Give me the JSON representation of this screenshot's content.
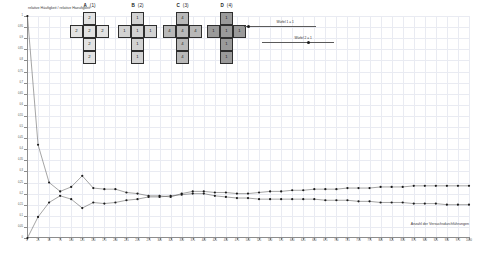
{
  "chart_data": {
    "type": "line",
    "title": "",
    "ylabel": "relative Häufigkeit / relative Haeufigkeit",
    "xlabel": "Anzahl der Versuchsdurchführungen",
    "grid": true,
    "legend_position": "top-right",
    "xlim": [
      0,
      1000
    ],
    "ylim": [
      0,
      1
    ],
    "y_ticks": [
      0,
      0.05,
      0.1,
      0.15,
      0.2,
      0.25,
      0.3,
      0.35,
      0.4,
      0.45,
      0.5,
      0.55,
      0.6,
      0.65,
      0.7,
      0.75,
      0.8,
      0.85,
      0.9,
      0.95,
      1
    ],
    "y_tick_labels": [
      "0",
      "0,05",
      "0,1",
      "0,15",
      "0,2",
      "0,25",
      "0,3",
      "0,35",
      "0,4",
      "0,45",
      "0,5",
      "0,55",
      "0,6",
      "0,65",
      "0,7",
      "0,75",
      "0,8",
      "0,85",
      "0,9",
      "0,95",
      "1"
    ],
    "x_ticks": [
      0,
      25,
      50,
      75,
      100,
      125,
      150,
      175,
      200,
      225,
      250,
      275,
      300,
      325,
      350,
      375,
      400,
      425,
      450,
      475,
      500,
      525,
      550,
      575,
      600,
      625,
      650,
      675,
      700,
      725,
      750,
      775,
      800,
      825,
      850,
      875,
      900,
      925,
      950,
      975,
      1000
    ],
    "x_tick_labels": [
      "0",
      "25",
      "50",
      "75",
      "100",
      "125",
      "150",
      "175",
      "200",
      "225",
      "250",
      "275",
      "300",
      "325",
      "350",
      "375",
      "400",
      "425",
      "450",
      "475",
      "500",
      "525",
      "550",
      "575",
      "600",
      "625",
      "650",
      "675",
      "700",
      "725",
      "750",
      "775",
      "800",
      "825",
      "850",
      "875",
      "900",
      "925",
      "950",
      "975",
      "1000"
    ],
    "series": [
      {
        "name": "Serie 1",
        "color": "#5a5a5a",
        "x": [
          1,
          25,
          50,
          75,
          100,
          125,
          150,
          175,
          200,
          225,
          250,
          275,
          300,
          325,
          350,
          375,
          400,
          425,
          450,
          475,
          500,
          525,
          550,
          575,
          600,
          625,
          650,
          675,
          700,
          725,
          750,
          775,
          800,
          825,
          850,
          875,
          900,
          925,
          950,
          975,
          1000
        ],
        "y": [
          1.0,
          0.42,
          0.25,
          0.21,
          0.23,
          0.28,
          0.225,
          0.22,
          0.22,
          0.205,
          0.2,
          0.19,
          0.19,
          0.185,
          0.2,
          0.21,
          0.21,
          0.205,
          0.205,
          0.2,
          0.2,
          0.205,
          0.21,
          0.21,
          0.215,
          0.215,
          0.22,
          0.22,
          0.22,
          0.225,
          0.225,
          0.225,
          0.23,
          0.23,
          0.23,
          0.235,
          0.235,
          0.235,
          0.235,
          0.235,
          0.235
        ]
      },
      {
        "name": "Serie 2",
        "color": "#5a5a5a",
        "x": [
          1,
          25,
          50,
          75,
          100,
          125,
          150,
          175,
          200,
          225,
          250,
          275,
          300,
          325,
          350,
          375,
          400,
          425,
          450,
          475,
          500,
          525,
          550,
          575,
          600,
          625,
          650,
          675,
          700,
          725,
          750,
          775,
          800,
          825,
          850,
          875,
          900,
          925,
          950,
          975,
          1000
        ],
        "y": [
          0.0,
          0.095,
          0.16,
          0.19,
          0.175,
          0.135,
          0.16,
          0.155,
          0.16,
          0.17,
          0.175,
          0.185,
          0.185,
          0.19,
          0.195,
          0.2,
          0.2,
          0.19,
          0.185,
          0.18,
          0.18,
          0.175,
          0.175,
          0.175,
          0.175,
          0.175,
          0.175,
          0.17,
          0.17,
          0.17,
          0.165,
          0.165,
          0.16,
          0.16,
          0.16,
          0.155,
          0.155,
          0.155,
          0.15,
          0.15,
          0.15
        ]
      }
    ]
  },
  "nets": [
    {
      "letter": "A",
      "index": "(1)",
      "shade": "#e2e2e2",
      "cells": {
        "top": "2",
        "left": "2",
        "mid": "2",
        "right": "2",
        "bot": "2",
        "bot2": "2"
      }
    },
    {
      "letter": "B",
      "index": "(2)",
      "shade": "#d2d2d2",
      "cells": {
        "top": "1",
        "left": "1",
        "mid": "1",
        "right": "1",
        "bot": "1",
        "bot2": "1"
      }
    },
    {
      "letter": "C",
      "index": "(3)",
      "shade": "#b8b8b8",
      "cells": {
        "top": "4",
        "left": "4",
        "mid": "4",
        "right": "4",
        "bot": "4",
        "bot2": "4"
      }
    },
    {
      "letter": "D",
      "index": "(4)",
      "shade": "#9a9a9a",
      "cells": {
        "top": "1",
        "left": "1",
        "mid": "1",
        "right": "1",
        "bot": "1",
        "bot2": "1"
      }
    }
  ],
  "sliders": [
    {
      "label": "Würfel 1 = 1",
      "value_pos": 0.04
    },
    {
      "label": "Würfel 2 = 1",
      "value_pos": 0.62
    }
  ]
}
